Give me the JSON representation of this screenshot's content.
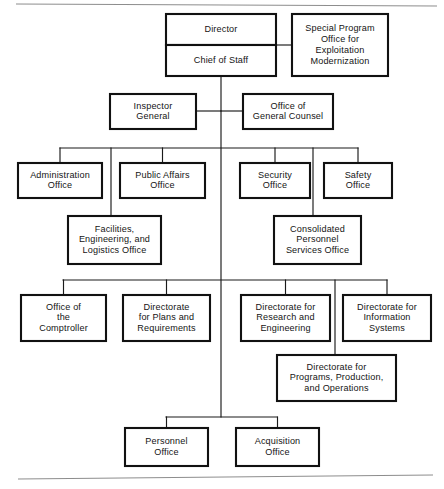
{
  "chart_data": {
    "type": "diagram",
    "title": "",
    "diagram_kind": "organization-chart",
    "nodes": [
      {
        "id": "director",
        "label": "Director",
        "lines": [
          "Director"
        ],
        "x": 166,
        "y": 14,
        "w": 110,
        "h": 31,
        "tier": 1
      },
      {
        "id": "chief-of-staff",
        "label": "Chief of Staff",
        "lines": [
          "Chief of Staff"
        ],
        "x": 166,
        "y": 45,
        "w": 110,
        "h": 31,
        "tier": 1
      },
      {
        "id": "special-program",
        "label": "Special Program Office for Exploitation Modernization",
        "lines": [
          "Special Program",
          "Office for",
          "Exploitation",
          "Modernization"
        ],
        "x": 292,
        "y": 14,
        "w": 96,
        "h": 62,
        "tier": 1
      },
      {
        "id": "inspector-general",
        "label": "Inspector General",
        "lines": [
          "Inspector",
          "General"
        ],
        "x": 110,
        "y": 94,
        "w": 86,
        "h": 35,
        "tier": 2
      },
      {
        "id": "general-counsel",
        "label": "Office of General Counsel",
        "lines": [
          "Office of",
          "General Counsel"
        ],
        "x": 243,
        "y": 94,
        "w": 90,
        "h": 35,
        "tier": 2
      },
      {
        "id": "administration-office",
        "label": "Administration Office",
        "lines": [
          "Administration",
          "Office"
        ],
        "x": 18,
        "y": 163,
        "w": 84,
        "h": 35,
        "tier": 3
      },
      {
        "id": "public-affairs-office",
        "label": "Public Affairs Office",
        "lines": [
          "Public Affairs",
          "Office"
        ],
        "x": 120,
        "y": 163,
        "w": 85,
        "h": 35,
        "tier": 3
      },
      {
        "id": "security-office",
        "label": "Security Office",
        "lines": [
          "Security",
          "Office"
        ],
        "x": 240,
        "y": 163,
        "w": 70,
        "h": 35,
        "tier": 3
      },
      {
        "id": "safety-office",
        "label": "Safety Office",
        "lines": [
          "Safety",
          "Office"
        ],
        "x": 324,
        "y": 163,
        "w": 68,
        "h": 35,
        "tier": 3
      },
      {
        "id": "facilities-office",
        "label": "Facilities, Engineering, and Logistics Office",
        "lines": [
          "Facilities,",
          "Engineering, and",
          "Logistics Office"
        ],
        "x": 68,
        "y": 216,
        "w": 93,
        "h": 48,
        "tier": 4
      },
      {
        "id": "consolidated-personnel",
        "label": "Consolidated Personnel Services Office",
        "lines": [
          "Consolidated",
          "Personnel",
          "Services Office"
        ],
        "x": 274,
        "y": 216,
        "w": 87,
        "h": 48,
        "tier": 4
      },
      {
        "id": "office-comptroller",
        "label": "Office of the Comptroller",
        "lines": [
          "Office of",
          "the",
          "Comptroller"
        ],
        "x": 21,
        "y": 295,
        "w": 85,
        "h": 46,
        "tier": 5
      },
      {
        "id": "directorate-plans",
        "label": "Directorate for Plans and Requirements",
        "lines": [
          "Directorate",
          "for Plans and",
          "Requirements"
        ],
        "x": 123,
        "y": 295,
        "w": 87,
        "h": 46,
        "tier": 5
      },
      {
        "id": "directorate-research",
        "label": "Directorate for Research and Engineering",
        "lines": [
          "Directorate for",
          "Research and",
          "Engineering"
        ],
        "x": 241,
        "y": 295,
        "w": 89,
        "h": 46,
        "tier": 5
      },
      {
        "id": "directorate-information",
        "label": "Directorate for Information Systems",
        "lines": [
          "Directorate for",
          "Information",
          "Systems"
        ],
        "x": 343,
        "y": 295,
        "w": 88,
        "h": 46,
        "tier": 5
      },
      {
        "id": "directorate-programs",
        "label": "Directorate for Programs, Production, and Operations",
        "lines": [
          "Directorate for",
          "Programs, Production,",
          "and Operations"
        ],
        "x": 277,
        "y": 355,
        "w": 119,
        "h": 46,
        "tier": 6
      },
      {
        "id": "personnel-office",
        "label": "Personnel Office",
        "lines": [
          "Personnel",
          "Office"
        ],
        "x": 125,
        "y": 428,
        "w": 83,
        "h": 38,
        "tier": 7
      },
      {
        "id": "acquisition-office",
        "label": "Acquisition Office",
        "lines": [
          "Acquisition",
          "Office"
        ],
        "x": 236,
        "y": 428,
        "w": 83,
        "h": 38,
        "tier": 7
      }
    ],
    "edges": [
      {
        "from": "director",
        "to": "special-program",
        "kind": "staff-lateral"
      },
      {
        "from": "chief-of-staff",
        "to": "spine",
        "kind": "vertical-spine"
      },
      {
        "from": "spine",
        "to": "inspector-general",
        "kind": "staff-lateral"
      },
      {
        "from": "spine",
        "to": "general-counsel",
        "kind": "staff-lateral"
      },
      {
        "from": "spine",
        "to": "administration-office",
        "kind": "bus"
      },
      {
        "from": "spine",
        "to": "public-affairs-office",
        "kind": "bus"
      },
      {
        "from": "spine",
        "to": "security-office",
        "kind": "bus"
      },
      {
        "from": "spine",
        "to": "safety-office",
        "kind": "bus"
      },
      {
        "from": "spine",
        "to": "facilities-office",
        "kind": "bus-drop"
      },
      {
        "from": "spine",
        "to": "consolidated-personnel",
        "kind": "bus-drop"
      },
      {
        "from": "spine",
        "to": "office-comptroller",
        "kind": "bus"
      },
      {
        "from": "spine",
        "to": "directorate-plans",
        "kind": "bus"
      },
      {
        "from": "spine",
        "to": "directorate-research",
        "kind": "bus"
      },
      {
        "from": "spine",
        "to": "directorate-information",
        "kind": "bus"
      },
      {
        "from": "spine",
        "to": "directorate-programs",
        "kind": "bus-drop"
      },
      {
        "from": "spine",
        "to": "personnel-office",
        "kind": "bus"
      },
      {
        "from": "spine",
        "to": "acquisition-office",
        "kind": "bus"
      }
    ],
    "colors": {
      "box_stroke": "#111111",
      "box_fill": "#ffffff",
      "connector": "#1a1a1a",
      "rule": "#8d8d8d",
      "text": "#141414",
      "background": "#ffffff"
    }
  },
  "rules": {
    "top": {
      "x1": 16,
      "y1": 4,
      "x2": 437,
      "y2": 6
    },
    "bottom": {
      "x1": 18,
      "y1": 479,
      "x2": 433,
      "y2": 475
    }
  },
  "geometry": {
    "spine_x": 221,
    "spine_top_y": 76,
    "spine_bottom_y": 417,
    "lateral_tier2_y": 111,
    "bus_tier3_y": 148,
    "bus_tier3_x1": 60,
    "bus_tier3_x2": 358,
    "bus_tier5_y": 280,
    "bus_tier5_x1": 63,
    "bus_tier5_x2": 387,
    "bus_tier7_y": 417,
    "bus_tier7_x1": 166,
    "bus_tier7_x2": 277,
    "drop_left_x": 111,
    "drop_right_x": 313,
    "drop_programs_x": 335,
    "director_divider_y": 45
  }
}
